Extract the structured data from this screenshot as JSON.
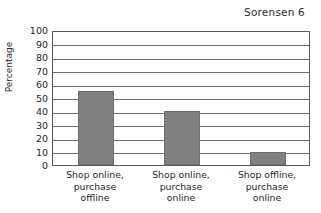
{
  "header": {
    "running_head": "Sorensen 6"
  },
  "chart_data": {
    "type": "bar",
    "title": "",
    "xlabel": "",
    "ylabel": "Percentage",
    "ylim": [
      0,
      100
    ],
    "ytick_step": 10,
    "yticks": [
      "100",
      "90",
      "80",
      "70",
      "60",
      "50",
      "40",
      "30",
      "20",
      "10",
      "0"
    ],
    "grid": true,
    "legend": "none",
    "categories": [
      "Shop online,\npurchase\noffline",
      "Shop online,\npurchase\nonline",
      "Shop offline,\npurchase\nonline"
    ],
    "values": [
      55,
      40,
      10
    ],
    "bar_color": "#808080",
    "frame_color": "#5b5b5b",
    "grid_color": "#6f6f6f"
  }
}
